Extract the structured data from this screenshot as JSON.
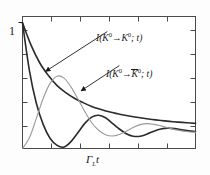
{
  "figure": {
    "background_color": "#fdfdfd",
    "frame_color": "#4a4a4a",
    "axis": {
      "y_tick_label": "1",
      "x_label_gamma": "Γ",
      "x_label_sub": "L",
      "x_label_t": "t",
      "x_label_full": "Γ_L t",
      "y_ticks_count": 5,
      "x_ticks_count": 5
    },
    "labels": {
      "curve1": {
        "prefix": "I(",
        "k_first": "K",
        "sup_first": "0",
        "arrow": "→",
        "k_second": "K",
        "sup_second": "0",
        "suffix": "; t)",
        "plain": "I(K0 → K0; t)"
      },
      "curve2": {
        "prefix": "I(",
        "k_first": "K",
        "sup_first": "0",
        "arrow": "→",
        "k_second": "K",
        "sup_second": "0",
        "suffix": "; t)",
        "overline": true,
        "plain": "I(K0 → K̅0; t)"
      }
    }
  },
  "chart_data": {
    "type": "line",
    "title": "",
    "xlabel": "Γ_L t",
    "ylabel": "",
    "xlim": [
      0,
      10
    ],
    "ylim": [
      0,
      1.05
    ],
    "grid": false,
    "legend_position": "inline-annotations",
    "y_tick_values": [
      1
    ],
    "y_tick_labels": [
      "1"
    ],
    "x_tick_values": [
      2,
      4,
      6,
      8,
      10
    ],
    "x_tick_labels": [
      "",
      "",
      "",
      "",
      ""
    ],
    "series": [
      {
        "name": "I(K0 -> K0; t) smooth decay",
        "color": "#2b2b2b",
        "style": "solid",
        "width": 1.6,
        "x": [
          0.0,
          0.5,
          1.0,
          1.5,
          2.0,
          2.5,
          3.0,
          3.5,
          4.0,
          4.5,
          5.0,
          5.5,
          6.0,
          6.5,
          7.0,
          7.5,
          8.0,
          8.5,
          9.0,
          9.5,
          10.0
        ],
        "y": [
          1.0,
          0.82,
          0.68,
          0.58,
          0.5,
          0.445,
          0.4,
          0.365,
          0.335,
          0.312,
          0.292,
          0.276,
          0.262,
          0.25,
          0.24,
          0.231,
          0.223,
          0.216,
          0.21,
          0.205,
          0.2
        ]
      },
      {
        "name": "I(K0 -> K0; t) oscillating",
        "color": "#2b2b2b",
        "style": "solid",
        "width": 1.6,
        "x": [
          0.0,
          0.4,
          0.8,
          1.2,
          1.6,
          2.0,
          2.4,
          2.8,
          3.2,
          3.6,
          4.0,
          4.4,
          4.8,
          5.2,
          5.6,
          6.0,
          6.4,
          6.8,
          7.2,
          7.6,
          8.0,
          8.4,
          8.8,
          9.2,
          9.6,
          10.0
        ],
        "y": [
          1.0,
          0.62,
          0.36,
          0.19,
          0.08,
          0.025,
          0.012,
          0.055,
          0.125,
          0.2,
          0.25,
          0.265,
          0.245,
          0.2,
          0.155,
          0.118,
          0.098,
          0.098,
          0.115,
          0.138,
          0.155,
          0.162,
          0.158,
          0.148,
          0.14,
          0.135
        ]
      },
      {
        "name": "I(K0 -> K0bar; t)",
        "color": "#9a9a9a",
        "style": "solid",
        "width": 1.1,
        "x": [
          0.0,
          0.4,
          0.8,
          1.2,
          1.6,
          2.0,
          2.4,
          2.8,
          3.2,
          3.6,
          4.0,
          4.4,
          4.8,
          5.2,
          5.6,
          6.0,
          6.4,
          6.8,
          7.2,
          7.6,
          8.0,
          8.4,
          8.8,
          9.2,
          9.6,
          10.0
        ],
        "y": [
          0.0,
          0.085,
          0.24,
          0.4,
          0.52,
          0.575,
          0.56,
          0.49,
          0.395,
          0.295,
          0.205,
          0.145,
          0.11,
          0.1,
          0.112,
          0.138,
          0.168,
          0.19,
          0.198,
          0.192,
          0.18,
          0.165,
          0.15,
          0.14,
          0.133,
          0.13
        ]
      }
    ],
    "annotations": [
      {
        "text": "I(K0 -> K0; t)",
        "target_x": 1.35,
        "target_y": 0.615,
        "label_x": 4.9,
        "label_y": 0.93,
        "arrow": true
      },
      {
        "text": "I(K0 -> K0bar; t)",
        "target_x": 3.4,
        "target_y": 0.46,
        "label_x": 5.6,
        "label_y": 0.66,
        "arrow": true
      }
    ]
  }
}
